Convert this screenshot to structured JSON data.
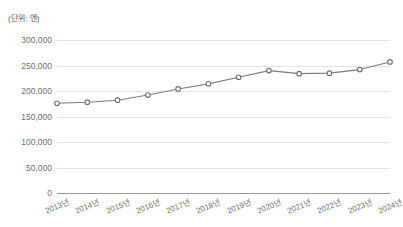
{
  "chart_data": {
    "type": "line",
    "title": "",
    "subtitle": "",
    "unit_caption": "(단위: 엔)",
    "xlabel": "",
    "ylabel": "",
    "categories": [
      "2013년",
      "2014년",
      "2015년",
      "2016년",
      "2017년",
      "2018년",
      "2019년",
      "2020년",
      "2021년",
      "2022년",
      "2023년",
      "2024년"
    ],
    "series": [
      {
        "name": "",
        "values": [
          176000,
          178000,
          182000,
          192000,
          204000,
          214000,
          227000,
          240000,
          234000,
          235000,
          242000,
          257000
        ]
      }
    ],
    "ylim": [
      0,
      300000
    ],
    "yticks": [
      0,
      50000,
      100000,
      150000,
      200000,
      250000,
      300000
    ],
    "ytick_labels": [
      "0",
      "50,000",
      "100,000",
      "150,000",
      "200,000",
      "250,000",
      "300,000"
    ],
    "grid": true,
    "legend": false,
    "legend_position": "none",
    "colors": {
      "line": "#7c7c7c",
      "marker_fill": "#ffffff",
      "marker_stroke": "#6f6f6f",
      "gridline": "#e3e3e3",
      "baseline": "#9a9a9a",
      "tick_text": "#6d6e71",
      "caption_text": "#58595b",
      "background": "#ffffff"
    }
  }
}
